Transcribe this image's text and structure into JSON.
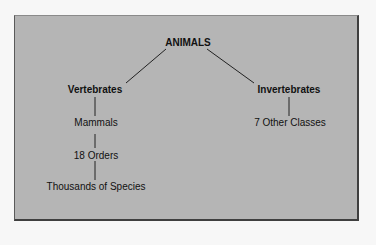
{
  "diagram": {
    "type": "hierarchy-tree",
    "root": {
      "label": "ANIMALS",
      "children": [
        {
          "label": "Vertebrates",
          "children": [
            {
              "label": "Mammals",
              "children": [
                {
                  "label": "18 Orders",
                  "children": [
                    {
                      "label": "Thousands of Species"
                    }
                  ]
                }
              ]
            }
          ]
        },
        {
          "label": "Invertebrates",
          "children": [
            {
              "label": "7 Other Classes"
            }
          ]
        }
      ]
    }
  },
  "nodes": {
    "root": "ANIMALS",
    "vertebrates": "Vertebrates",
    "invertebrates": "Invertebrates",
    "mammals": "Mammals",
    "orders": "18 Orders",
    "species": "Thousands of Species",
    "other_classes": "7 Other Classes"
  },
  "colors": {
    "panel_background": "#b5b5b5",
    "panel_border": "#3f3f3f",
    "text": "#111111",
    "page_background": "#f7f7f7"
  }
}
